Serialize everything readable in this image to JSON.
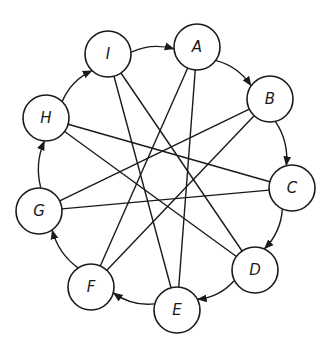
{
  "diagram": {
    "type": "directed-cycle-with-chords",
    "colors": {
      "stroke": "#1a1a1a",
      "node_fill": "#ffffff",
      "background": "#ffffff"
    },
    "node_radius": 23,
    "nodes": [
      {
        "id": "A",
        "label": "A",
        "x": 197,
        "y": 47
      },
      {
        "id": "B",
        "label": "B",
        "x": 270,
        "y": 99
      },
      {
        "id": "C",
        "label": "C",
        "x": 292,
        "y": 188
      },
      {
        "id": "D",
        "label": "D",
        "x": 255,
        "y": 270
      },
      {
        "id": "E",
        "label": "E",
        "x": 177,
        "y": 310
      },
      {
        "id": "F",
        "label": "F",
        "x": 91,
        "y": 287
      },
      {
        "id": "G",
        "label": "G",
        "x": 39,
        "y": 211
      },
      {
        "id": "H",
        "label": "H",
        "x": 46,
        "y": 118
      },
      {
        "id": "I",
        "label": "I",
        "x": 108,
        "y": 54
      }
    ],
    "ring_edges": [
      {
        "from": "I",
        "to": "A"
      },
      {
        "from": "A",
        "to": "B"
      },
      {
        "from": "B",
        "to": "C"
      },
      {
        "from": "C",
        "to": "D"
      },
      {
        "from": "D",
        "to": "E"
      },
      {
        "from": "E",
        "to": "F"
      },
      {
        "from": "F",
        "to": "G"
      },
      {
        "from": "G",
        "to": "H"
      },
      {
        "from": "H",
        "to": "I"
      }
    ],
    "chords": [
      {
        "from": "I",
        "to": "E"
      },
      {
        "from": "I",
        "to": "D"
      },
      {
        "from": "A",
        "to": "F"
      },
      {
        "from": "A",
        "to": "E"
      },
      {
        "from": "B",
        "to": "G"
      },
      {
        "from": "B",
        "to": "F"
      },
      {
        "from": "H",
        "to": "C"
      },
      {
        "from": "H",
        "to": "D"
      },
      {
        "from": "G",
        "to": "C"
      }
    ]
  }
}
